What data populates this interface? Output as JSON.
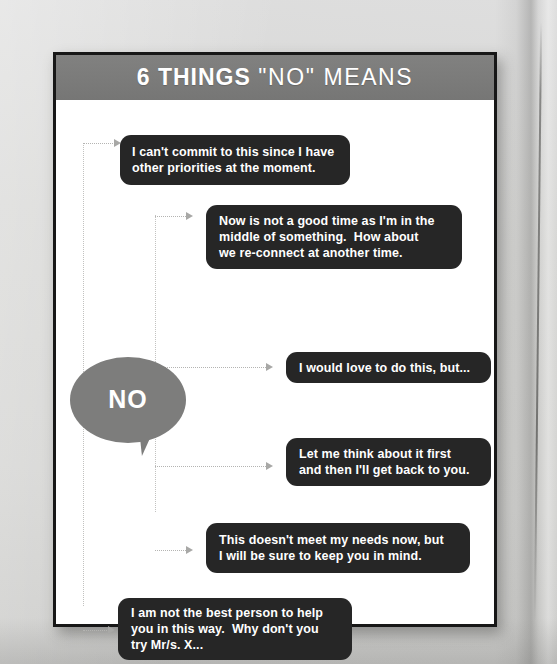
{
  "page": {
    "background_color": "#d7d7d5",
    "card_background": "#ffffff",
    "card_border_color": "#171717"
  },
  "header": {
    "band_color": "#7b7b7a",
    "title_strong": "6 THINGS",
    "title_light": "\"NO\" MEANS",
    "text_color": "#ffffff"
  },
  "bubble": {
    "label": "NO",
    "fill_color": "#7d7d7c",
    "text_color": "#ffffff"
  },
  "connectors": {
    "line_color": "#c2c2c0",
    "arrow_color": "#a8a8a6",
    "style": "dotted"
  },
  "messages": [
    {
      "id": 1,
      "lines": [
        "I can't commit to this since I have",
        "other priorities at the moment."
      ],
      "box_color": "#262626",
      "text_color": "#ffffff"
    },
    {
      "id": 2,
      "lines": [
        "Now is not a good time as I'm in the",
        "middle of something.  How about",
        "we re-connect at another time."
      ],
      "box_color": "#262626",
      "text_color": "#ffffff"
    },
    {
      "id": 3,
      "lines": [
        "I would love to do this, but..."
      ],
      "box_color": "#262626",
      "text_color": "#ffffff"
    },
    {
      "id": 4,
      "lines": [
        "Let me think about it first",
        "and then I'll get back to you."
      ],
      "box_color": "#262626",
      "text_color": "#ffffff"
    },
    {
      "id": 5,
      "lines": [
        "This doesn't meet my needs now, but",
        "I will be sure to keep you in mind."
      ],
      "box_color": "#262626",
      "text_color": "#ffffff"
    },
    {
      "id": 6,
      "lines": [
        "I am not the best person to help",
        "you in this way.  Why don't you",
        "try Mr/s. X..."
      ],
      "box_color": "#262626",
      "text_color": "#ffffff"
    }
  ]
}
